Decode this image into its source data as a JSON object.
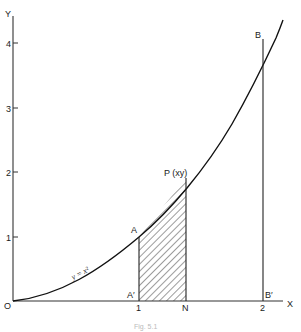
{
  "figure": {
    "axes": {
      "x_label": "X",
      "y_label": "Y",
      "origin_label": "O",
      "x_ticks": [
        "1",
        "2"
      ],
      "y_ticks": [
        "1",
        "2",
        "3",
        "4"
      ]
    },
    "curve": {
      "equation": "y = x²",
      "label": "y = x²"
    },
    "points": {
      "A": "A",
      "A_prime": "A′",
      "B": "B",
      "B_prime": "B′",
      "P": "P (xy)",
      "N": "N"
    },
    "shaded_region": {
      "from_x": 1,
      "to_x": 1.38,
      "pattern": "diagonal hatch"
    },
    "caption": "Fig. 5.1"
  }
}
